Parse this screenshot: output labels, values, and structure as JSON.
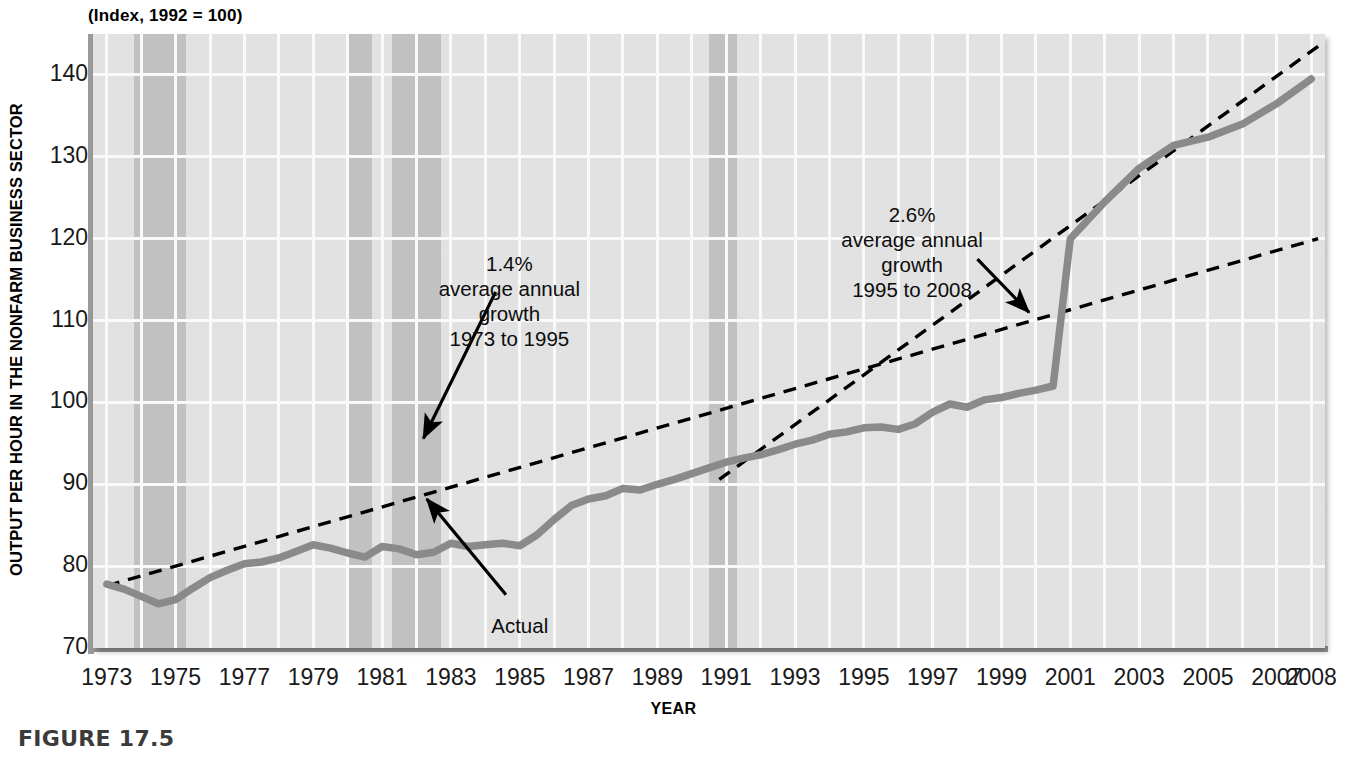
{
  "figure": {
    "caption": "FIGURE 17.5",
    "index_note": "(Index, 1992 = 100)"
  },
  "chart_data": {
    "type": "line",
    "title": "",
    "subtitle": "(Index, 1992 = 100)",
    "xlabel": "YEAR",
    "ylabel": "OUTPUT PER HOUR IN THE NONFARM BUSINESS SECTOR",
    "xlim": [
      1972.6,
      2008.4
    ],
    "ylim": [
      70,
      145
    ],
    "yticks": [
      70,
      80,
      90,
      100,
      110,
      120,
      130,
      140
    ],
    "ytick_labels": [
      "70",
      "80",
      "90",
      "100",
      "110",
      "120",
      "130",
      "140"
    ],
    "xticks": [
      1973,
      1975,
      1977,
      1979,
      1981,
      1983,
      1985,
      1987,
      1989,
      1991,
      1993,
      1995,
      1997,
      1999,
      2001,
      2003,
      2005,
      2007,
      2008
    ],
    "xtick_labels": [
      "1973",
      "1975",
      "1977",
      "1979",
      "1981",
      "1983",
      "1985",
      "1987",
      "1989",
      "1991",
      "1993",
      "1995",
      "1997",
      "1999",
      "2001",
      "2003",
      "2005",
      "2007",
      "2008"
    ],
    "grid": true,
    "legend": "none",
    "series": [
      {
        "name": "Actual",
        "style": "solid",
        "color": "#8a8a8a",
        "x": [
          1973.0,
          1973.5,
          1974.0,
          1974.5,
          1975.0,
          1975.5,
          1976.0,
          1976.5,
          1977.0,
          1977.5,
          1978.0,
          1978.5,
          1979.0,
          1979.5,
          1980.0,
          1980.5,
          1981.0,
          1981.5,
          1982.0,
          1982.5,
          1983.0,
          1983.5,
          1984.0,
          1984.5,
          1985.0,
          1985.5,
          1986.0,
          1986.5,
          1987.0,
          1987.5,
          1988.0,
          1988.5,
          1989.0,
          1989.5,
          1990.0,
          1990.5,
          1991.0,
          1991.5,
          1992.0,
          1992.5,
          1993.0,
          1993.5,
          1994.0,
          1994.5,
          1995.0,
          1995.5,
          1996.0,
          1996.5,
          1997.0,
          1997.5,
          1998.0,
          1998.5,
          1999.0,
          1999.5,
          2000.0,
          2000.5,
          2001.0,
          2001.5,
          2002.0,
          2002.5,
          2003.0,
          2003.5,
          2004.0,
          2004.5,
          2005.0,
          2005.5,
          2006.0,
          2006.5,
          2007.0,
          2007.5,
          2008.0
        ],
        "y": [
          77.8,
          77.2,
          76.3,
          75.4,
          75.9,
          77.3,
          78.6,
          79.5,
          80.3,
          80.5,
          81.0,
          81.8,
          82.6,
          82.2,
          81.6,
          81.1,
          82.4,
          82.1,
          81.4,
          81.7,
          82.8,
          82.4,
          82.6,
          82.8,
          82.5,
          83.8,
          85.7,
          87.4,
          88.2,
          88.6,
          89.5,
          89.3,
          90.0,
          90.6,
          91.3,
          92.0,
          92.7,
          93.2,
          93.6,
          94.2,
          94.9,
          95.4,
          96.1,
          96.4,
          96.9,
          97.0,
          96.7,
          97.4,
          98.8,
          99.8,
          99.4,
          100.3,
          100.6,
          101.1,
          101.5,
          102.0,
          102.6,
          103.3,
          104.0,
          105.0,
          106.2,
          107.2,
          107.8,
          109.2,
          111.0,
          113.0,
          115.1,
          117.5,
          119.0,
          119.3,
          121.5
        ]
      },
      {
        "name": "1.4% trend 1973-1995",
        "style": "dashed",
        "color": "#000000",
        "x": [
          1973.0,
          2008.2
        ],
        "y": [
          77.6,
          120.0
        ],
        "annotation_pct": "1.4%"
      },
      {
        "name": "2.6% trend 1995-2008",
        "style": "dashed",
        "color": "#000000",
        "x": [
          1990.8,
          2008.2
        ],
        "y": [
          90.6,
          143.5
        ],
        "annotation_pct": "2.6%"
      }
    ],
    "actual_2001_2008": {
      "note": "line continues to about 139.5 at 2008",
      "x": [
        2001.0,
        2002.0,
        2003.0,
        2004.0,
        2005.0,
        2006.0,
        2007.0,
        2008.0
      ],
      "y": [
        120.0,
        124.5,
        128.6,
        131.4,
        132.4,
        134.0,
        136.5,
        139.5
      ]
    },
    "recession_bands": [
      {
        "start": 1973.8,
        "end": 1975.3,
        "label": "1973-75 recession"
      },
      {
        "start": 1980.0,
        "end": 1980.7,
        "label": "1980 recession"
      },
      {
        "start": 1981.3,
        "end": 1982.7,
        "label": "1981-82 recession"
      },
      {
        "start": 1990.5,
        "end": 1991.3,
        "label": "1990-91 recession"
      }
    ],
    "annotations": [
      {
        "id": "growth-1",
        "lines": [
          "1.4%",
          "average annual",
          "growth",
          "1973 to 1995"
        ],
        "x": 1984.7,
        "y": 118.5
      },
      {
        "id": "growth-2",
        "lines": [
          "2.6%",
          "average annual",
          "growth",
          "1995 to 2008"
        ],
        "x": 1996.4,
        "y": 124.5
      },
      {
        "id": "actual-label",
        "lines": [
          "Actual"
        ],
        "x": 1985.0,
        "y": 74.2
      }
    ]
  },
  "colors": {
    "plot_background": "#e3e3e3",
    "recession_band": "#c2c2c2",
    "gridline": "#fbfbfb",
    "actual_line": "#8a8a8a",
    "trend_line": "#000000",
    "axis": "#9a9a9a",
    "caption": "#3b3b3b"
  }
}
